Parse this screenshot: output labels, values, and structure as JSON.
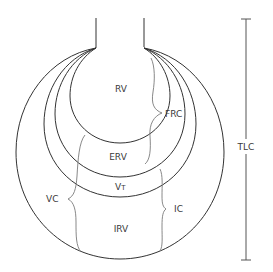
{
  "diagram": {
    "labels": {
      "rv": "RV",
      "frc": "FRC",
      "erv": "ERV",
      "vt_main": "V",
      "vt_sub": "T",
      "irv": "IRV",
      "ic": "IC",
      "vc": "VC",
      "tlc": "TLC"
    },
    "regions": [
      {
        "id": "RV",
        "name": "Residual volume"
      },
      {
        "id": "ERV",
        "name": "Expiratory reserve volume"
      },
      {
        "id": "VT",
        "name": "Tidal volume"
      },
      {
        "id": "IRV",
        "name": "Inspiratory reserve volume"
      }
    ],
    "capacities": [
      {
        "id": "FRC",
        "spans": [
          "RV",
          "ERV"
        ]
      },
      {
        "id": "IC",
        "spans": [
          "VT",
          "IRV"
        ]
      },
      {
        "id": "VC",
        "spans": [
          "ERV",
          "VT",
          "IRV"
        ]
      },
      {
        "id": "TLC",
        "spans": [
          "RV",
          "ERV",
          "VT",
          "IRV"
        ]
      }
    ],
    "colors": {
      "stroke": "#333333",
      "brace": "#7a7a7a",
      "text": "#3a3a3a",
      "background": "#ffffff"
    }
  }
}
